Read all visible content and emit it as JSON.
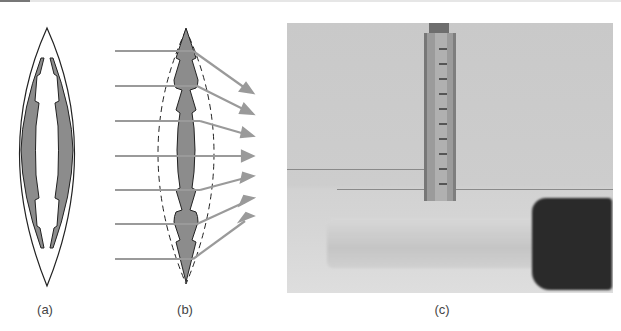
{
  "figure": {
    "panels": [
      {
        "id": "a",
        "label": "(a)",
        "description": "Lens cross-section with stepped inner profile (Fresnel-like), gray shaded outer shell"
      },
      {
        "id": "b",
        "label": "(b)",
        "description": "Stepped lens with dashed original convex lens outline; seven parallel rays refracted toward focus"
      },
      {
        "id": "c",
        "label": "(c)",
        "description": "Photograph of a transparent flat lens on a table, with a vertical ruler and a dark block"
      }
    ],
    "ray_count": 7,
    "colors": {
      "lens_fill": "#8c8c8c",
      "ray": "#9a9a9a",
      "outline": "#222222",
      "label_text": "#444444"
    }
  }
}
